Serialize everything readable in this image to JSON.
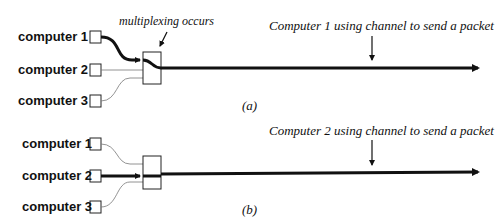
{
  "panel_a": {
    "computers": [
      "computer 1",
      "computer 2",
      "computer 3"
    ],
    "annotation_mux": "multiplexing occurs",
    "annotation_channel": "Computer 1 using channel to send a packet",
    "caption": "(a)",
    "active_computer": 1
  },
  "panel_b": {
    "computers": [
      "computer 1",
      "computer 2",
      "computer 3"
    ],
    "annotation_channel": "Computer 2 using channel to send a packet",
    "caption": "(b)",
    "active_computer": 2
  },
  "colors": {
    "line": "#111111",
    "thin_line": "#777777",
    "background": "#ffffff"
  }
}
